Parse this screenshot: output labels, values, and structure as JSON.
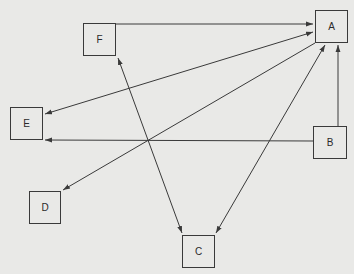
{
  "diagram": {
    "background": "#e9e9e7",
    "stroke": "#3a3a3a",
    "nodes": [
      {
        "id": "A",
        "label": "A",
        "x": 315,
        "y": 10,
        "w": 33,
        "h": 33
      },
      {
        "id": "F",
        "label": "F",
        "x": 83,
        "y": 23,
        "w": 33,
        "h": 33
      },
      {
        "id": "E",
        "label": "E",
        "x": 10,
        "y": 107,
        "w": 33,
        "h": 33
      },
      {
        "id": "B",
        "label": "B",
        "x": 313,
        "y": 126,
        "w": 34,
        "h": 33
      },
      {
        "id": "D",
        "label": "D",
        "x": 29,
        "y": 191,
        "w": 32,
        "h": 33
      },
      {
        "id": "C",
        "label": "C",
        "x": 182,
        "y": 235,
        "w": 33,
        "h": 33
      }
    ],
    "edges": [
      {
        "from": "F",
        "to": "A",
        "arrows": [
          "end"
        ]
      },
      {
        "from": "E",
        "to": "A",
        "arrows": [
          "start",
          "end"
        ]
      },
      {
        "from": "A",
        "to": "D",
        "arrows": [
          "end"
        ]
      },
      {
        "from": "B",
        "to": "E",
        "arrows": [
          "end"
        ]
      },
      {
        "from": "B",
        "to": "A",
        "arrows": [
          "end"
        ]
      },
      {
        "from": "F",
        "to": "C",
        "arrows": [
          "start",
          "end"
        ]
      },
      {
        "from": "C",
        "to": "A",
        "arrows": [
          "start",
          "end"
        ]
      }
    ]
  }
}
